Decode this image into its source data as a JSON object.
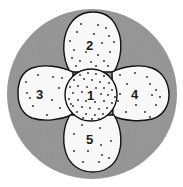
{
  "diagram": {
    "colors": {
      "background": "#ffffff",
      "outer_fill": "#9a9a9a",
      "region_fill": "#f8f8f8",
      "stroke": "#111111",
      "dot": "#222222"
    },
    "regions": [
      {
        "id": "1",
        "label": "1",
        "shape": "circle",
        "position": "center"
      },
      {
        "id": "2",
        "label": "2",
        "shape": "petal",
        "position": "top"
      },
      {
        "id": "3",
        "label": "3",
        "shape": "petal",
        "position": "left"
      },
      {
        "id": "4",
        "label": "4",
        "shape": "petal",
        "position": "right"
      },
      {
        "id": "5",
        "label": "5",
        "shape": "petal",
        "position": "bottom"
      }
    ]
  }
}
